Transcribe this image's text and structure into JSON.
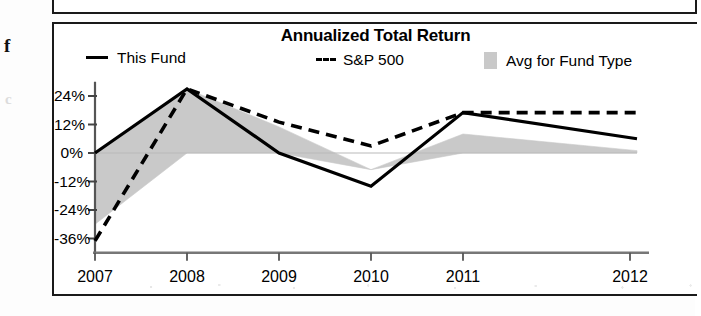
{
  "panel": {
    "title": "Annualized Total Return"
  },
  "legend": {
    "items": [
      {
        "label": "This Fund",
        "marker": "solid-line-swatch",
        "color": "#000000"
      },
      {
        "label": "S&P 500",
        "marker": "dashed-line-swatch",
        "color": "#000000"
      },
      {
        "label": "Avg for Fund Type",
        "marker": "shaded-band-swatch",
        "color": "#c9c9c9"
      }
    ]
  },
  "axis": {
    "y_ticks": [
      "24%",
      "12%",
      "0%",
      "-12%",
      "-24%",
      "-36%"
    ],
    "x_ticks": [
      "2007",
      "2008",
      "2009",
      "2010",
      "2011",
      "2012"
    ],
    "x_suffix": "YTD"
  },
  "chart_data": {
    "type": "line",
    "title": "Annualized Total Return",
    "xlabel": "",
    "ylabel": "",
    "x": [
      "2007",
      "2008",
      "2009",
      "2010",
      "2011",
      "2012"
    ],
    "x_note": "2012 value is year-to-date (YTD)",
    "ylim": [
      -42,
      30
    ],
    "ytick_values": [
      24,
      12,
      0,
      -12,
      -24,
      -36
    ],
    "ytick_labels": [
      "24%",
      "12%",
      "0%",
      "-12%",
      "-24%",
      "-36%"
    ],
    "grid": false,
    "legend_position": "top",
    "zero_line": 0,
    "series": [
      {
        "name": "This Fund",
        "style": "solid",
        "color": "#000000",
        "values": [
          0,
          27,
          0,
          -14,
          17,
          6
        ]
      },
      {
        "name": "S&P 500",
        "style": "dashed",
        "color": "#000000",
        "values": [
          -37,
          27,
          13,
          3,
          17,
          17
        ]
      },
      {
        "name": "Avg for Fund Type",
        "style": "shaded-band",
        "color": "#c9c9c9",
        "values": [
          -30,
          27,
          11,
          -7,
          8,
          1
        ],
        "band_baseline": [
          0,
          0,
          0,
          -7,
          0,
          0
        ]
      }
    ]
  }
}
